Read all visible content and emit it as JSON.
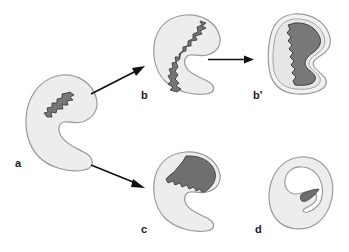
{
  "figure": {
    "background": "#ffffff",
    "width": 349,
    "height": 252
  },
  "colors": {
    "body_fill": "#ededed",
    "body_outline": "#9a9a9a",
    "rim_fill": "#f4f4f4",
    "lesion_fill": "#767676",
    "lesion_fill_dark": "#6b6b6b",
    "lesion_outline": "#4a4a4a",
    "arrow": "#111111",
    "label": "#1a1a1a"
  },
  "panels": [
    {
      "id": "a",
      "label": "a",
      "name": "panel-a",
      "description": "Crescent-shaped body opening to the right with a small dark jagged lesion in the upper-left wall"
    },
    {
      "id": "b",
      "label": "b",
      "name": "panel-b",
      "description": "Crescent-shaped body with an elongated dark band lining the entire inner concave margin"
    },
    {
      "id": "bprime",
      "label": "b'",
      "name": "panel-b-prime",
      "description": "Closed rounded body filled by a large dark mass surrounded by a thin pale rim"
    },
    {
      "id": "c",
      "label": "c",
      "name": "panel-c",
      "description": "Crescent-shaped body with a dark wedge confined to the upper arm"
    },
    {
      "id": "d",
      "label": "d",
      "name": "panel-d",
      "description": "Nearly closed ring-shaped body with a small dark sliver at the inrolled tip"
    }
  ],
  "arrows": [
    {
      "id": "a-to-b",
      "name": "arrow-a-to-b",
      "from": "a",
      "to": "b",
      "direction": "up-right"
    },
    {
      "id": "a-to-c",
      "name": "arrow-a-to-c",
      "from": "a",
      "to": "c",
      "direction": "down-right"
    },
    {
      "id": "b-to-bprime",
      "name": "arrow-b-to-b-prime",
      "from": "b",
      "to": "bprime",
      "direction": "right"
    }
  ]
}
